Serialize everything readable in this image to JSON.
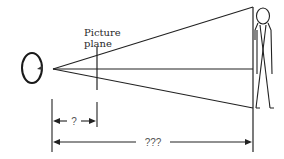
{
  "diagram": {
    "labels": {
      "picture_plane_line1": "Picture",
      "picture_plane_line2": "plane",
      "near_distance": "?",
      "far_distance": "???"
    },
    "elements": {
      "eye": "eye-icon",
      "figure": "stick-figure-icon"
    },
    "colors": {
      "stroke": "#222222",
      "background": "#ffffff",
      "dim_text": "#555555"
    }
  }
}
